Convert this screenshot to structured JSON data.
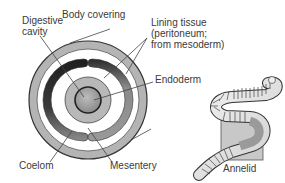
{
  "diagram": {
    "type": "cross-section",
    "labels": {
      "digestive_cavity_line1": "Digestive",
      "digestive_cavity_line2": "cavity",
      "body_covering": "Body covering",
      "lining_tissue_line1": "Lining tissue",
      "lining_tissue_line2": "(peritoneum;",
      "lining_tissue_line3": "from mesoderm)",
      "endoderm": "Endoderm",
      "coelom": "Coelom",
      "mesentery": "Mesentery",
      "organism": "Annelid"
    },
    "colors": {
      "body_covering": "#b4b4b4",
      "coelom_dark": "#2a2a2a",
      "coelom_mid": "#8a8a8a",
      "gut_ring": "#b8b8b8",
      "gut_center": "#9a9a9a",
      "outline": "#333333",
      "leader_line": "#444444",
      "section_square": "#c8c8c8"
    }
  }
}
